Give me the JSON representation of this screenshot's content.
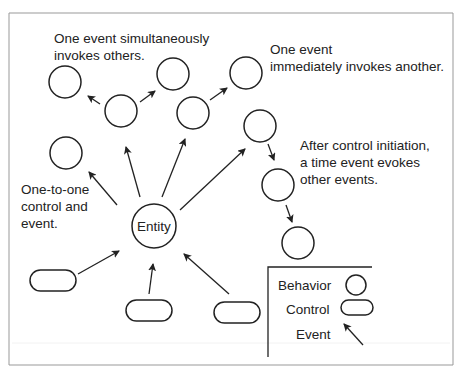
{
  "annotations": {
    "simultaneous": [
      "One event simultaneously",
      "invokes others."
    ],
    "immediate": [
      "One event",
      "immediately invokes another."
    ],
    "time_event": [
      "After control initiation,",
      "a time event evokes",
      "other events."
    ],
    "one_to_one": [
      "One-to-one",
      "control and",
      "event."
    ]
  },
  "entity": {
    "label": "Entity"
  },
  "legend": {
    "behavior": "Behavior",
    "control": "Control",
    "event": "Event"
  },
  "colors": {
    "stroke": "#222222",
    "frame": "#888888",
    "background": "#ffffff"
  }
}
